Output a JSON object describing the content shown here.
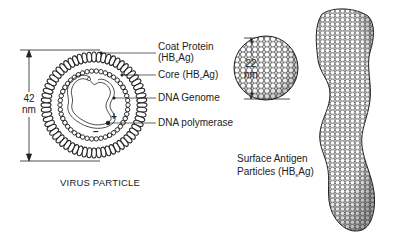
{
  "virus_particle": {
    "caption": "VIRUS PARTICLE",
    "dimension": {
      "value": "42",
      "unit": "nm"
    },
    "labels": [
      {
        "id": "coat-protein",
        "line1": "Coat Protein",
        "line2_prefix": "(HB",
        "line2_sub": "s",
        "line2_suffix": "Ag)"
      },
      {
        "id": "core",
        "prefix": "Core (HB",
        "sub": "c",
        "suffix": "Ag)"
      },
      {
        "id": "dna-genome",
        "text": "DNA Genome"
      },
      {
        "id": "dna-polymerase",
        "text": "DNA polymerase"
      }
    ],
    "genome_signs": {
      "plus": "+",
      "minus": "−"
    }
  },
  "surface_antigen": {
    "dimension": {
      "value": "22",
      "unit": "nm"
    },
    "label_line1": "Surface Antigen",
    "label_line2_prefix": "Particles (HB",
    "label_line2_sub": "s",
    "label_line2_suffix": "Ag)"
  },
  "colors": {
    "ink": "#222222",
    "background": "#ffffff"
  }
}
